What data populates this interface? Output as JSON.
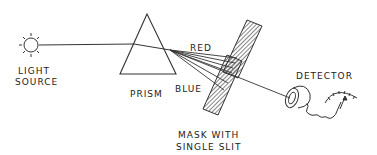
{
  "diagram": {
    "labels": {
      "light_source_line1": "LIGHT",
      "light_source_line2": "SOURCE",
      "prism": "PRISM",
      "red": "RED",
      "blue": "BLUE",
      "mask_line1": "MASK WITH",
      "mask_line2": "SINGLE SLIT",
      "detector": "DETECTOR"
    },
    "components": [
      {
        "name": "light-source",
        "icon": "sun-icon"
      },
      {
        "name": "prism",
        "shape": "triangle"
      },
      {
        "name": "mask",
        "shape": "hatched-bar",
        "feature": "single slit"
      },
      {
        "name": "detector",
        "icon": "eyepiece-icon"
      },
      {
        "name": "meter",
        "icon": "gauge-icon"
      }
    ],
    "colors": {
      "line": "#333333",
      "background": "#ffffff"
    }
  }
}
